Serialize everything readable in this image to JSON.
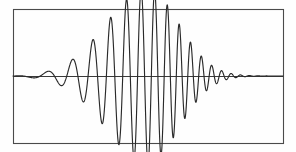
{
  "figure": {
    "name": "wave-packet-plot",
    "background_color": "#fefefe",
    "width": 296,
    "height": 152
  },
  "frame": {
    "label": "plot-frame",
    "x": 13,
    "y": 9,
    "width": 270,
    "height": 134,
    "stroke_color": "#4a4a4a",
    "stroke_width": 1.1
  },
  "axis": {
    "label": "zero-baseline-axis",
    "y": 76,
    "x_start": 13,
    "x_end": 283,
    "stroke_color": "#3a3a3a"
  },
  "curve": {
    "label": "wave-packet-curve",
    "stroke_color": "#2a2a2a",
    "stroke_width": 1.15,
    "clipped_top": true,
    "clipped_bottom": true
  },
  "chart_data": {
    "type": "line",
    "title": "",
    "subtitle": "",
    "xlabel": "",
    "ylabel": "",
    "legend": [],
    "grid": false,
    "annotations": [],
    "xlim": [
      0,
      1
    ],
    "ylim": [
      -1.35,
      1.35
    ],
    "axis_baseline": 0,
    "envelope": {
      "type": "asymmetric-gaussian",
      "peak_x": 0.497,
      "rise_width": 0.215,
      "decay_width": 0.165,
      "peak_amplitude": 1.3,
      "flat_lead_in_until_x": 0.035
    },
    "chirp": {
      "description": "instantaneous frequency increases left to right",
      "phase_cycles_start": 0.0,
      "phase_cycles_end": 21.5,
      "frequency_start_cycles_per_unit": 6.0,
      "frequency_end_cycles_per_unit": 34.0
    },
    "series": [
      {
        "name": "wave packet",
        "color": "#2a2a2a",
        "x": [
          0.0,
          0.02,
          0.04,
          0.06,
          0.08,
          0.1,
          0.12,
          0.14,
          0.16,
          0.18,
          0.2,
          0.22,
          0.24,
          0.26,
          0.28,
          0.3,
          0.32,
          0.34,
          0.36,
          0.38,
          0.4,
          0.42,
          0.44,
          0.46,
          0.48,
          0.5,
          0.52,
          0.54,
          0.56,
          0.58,
          0.6,
          0.62,
          0.64,
          0.66,
          0.68,
          0.7,
          0.72,
          0.74,
          0.76,
          0.78,
          0.8,
          0.82,
          0.84,
          0.86,
          0.88,
          0.9,
          0.92,
          0.94,
          0.96,
          0.98,
          1.0
        ],
        "y": [
          0.0,
          0.01,
          0.06,
          0.11,
          0.09,
          0.0,
          -0.13,
          -0.18,
          -0.09,
          0.12,
          0.33,
          0.4,
          0.27,
          -0.05,
          -0.41,
          -0.62,
          -0.55,
          -0.17,
          0.35,
          0.76,
          0.84,
          0.52,
          -0.07,
          -0.69,
          -1.05,
          -0.96,
          -0.4,
          0.4,
          1.08,
          1.25,
          0.83,
          -0.02,
          -0.88,
          -1.28,
          -1.0,
          -0.22,
          0.67,
          1.15,
          0.98,
          0.26,
          -0.57,
          -1.0,
          -0.82,
          -0.18,
          0.5,
          0.82,
          0.62,
          0.1,
          -0.4,
          -0.62,
          -0.4
        ]
      }
    ],
    "peaks": [
      {
        "x_px": 25,
        "y_px": 70,
        "amplitude": 0.09
      },
      {
        "x_px": 45,
        "y_px": 62,
        "amplitude": 0.21
      },
      {
        "x_px": 62,
        "y_px": 48,
        "amplitude": 0.42
      },
      {
        "x_px": 79,
        "y_px": 33,
        "amplitude": 0.65
      },
      {
        "x_px": 96,
        "y_px": 21,
        "amplitude": 0.83
      },
      {
        "x_px": 113,
        "y_px": 14,
        "amplitude": 0.94
      },
      {
        "x_px": 133,
        "y_px": 10,
        "amplitude": 1.0
      },
      {
        "x_px": 147,
        "y_px": 4,
        "amplitude": 1.3
      },
      {
        "x_px": 157,
        "y_px": 12,
        "amplitude": 0.97
      },
      {
        "x_px": 168,
        "y_px": 16,
        "amplitude": 0.9
      },
      {
        "x_px": 180,
        "y_px": 24,
        "amplitude": 0.78
      },
      {
        "x_px": 192,
        "y_px": 32,
        "amplitude": 0.66
      },
      {
        "x_px": 203,
        "y_px": 42,
        "amplitude": 0.51
      },
      {
        "x_px": 214,
        "y_px": 50,
        "amplitude": 0.39
      },
      {
        "x_px": 224,
        "y_px": 57,
        "amplitude": 0.28
      },
      {
        "x_px": 234,
        "y_px": 63,
        "amplitude": 0.19
      },
      {
        "x_px": 244,
        "y_px": 67,
        "amplitude": 0.13
      },
      {
        "x_px": 253,
        "y_px": 70,
        "amplitude": 0.09
      },
      {
        "x_px": 262,
        "y_px": 72,
        "amplitude": 0.06
      },
      {
        "x_px": 271,
        "y_px": 74,
        "amplitude": 0.03
      }
    ],
    "troughs": [
      {
        "x_px": 35,
        "y_px": 82,
        "amplitude": -0.09
      },
      {
        "x_px": 53,
        "y_px": 90,
        "amplitude": -0.21
      },
      {
        "x_px": 70,
        "y_px": 104,
        "amplitude": -0.42
      },
      {
        "x_px": 87,
        "y_px": 119,
        "amplitude": -0.64
      },
      {
        "x_px": 104,
        "y_px": 131,
        "amplitude": -0.82
      },
      {
        "x_px": 122,
        "y_px": 139,
        "amplitude": -0.94
      },
      {
        "x_px": 137,
        "y_px": 143,
        "amplitude": -1.0
      },
      {
        "x_px": 142,
        "y_px": 148,
        "amplitude": -1.28
      },
      {
        "x_px": 152,
        "y_px": 142,
        "amplitude": -0.99
      },
      {
        "x_px": 163,
        "y_px": 137,
        "amplitude": -0.91
      },
      {
        "x_px": 175,
        "y_px": 128,
        "amplitude": -0.78
      },
      {
        "x_px": 186,
        "y_px": 119,
        "amplitude": -0.65
      },
      {
        "x_px": 197,
        "y_px": 110,
        "amplitude": -0.51
      },
      {
        "x_px": 208,
        "y_px": 101,
        "amplitude": -0.38
      },
      {
        "x_px": 219,
        "y_px": 94,
        "amplitude": -0.28
      },
      {
        "x_px": 229,
        "y_px": 88,
        "amplitude": -0.19
      },
      {
        "x_px": 239,
        "y_px": 84,
        "amplitude": -0.13
      },
      {
        "x_px": 248,
        "y_px": 81,
        "amplitude": -0.09
      },
      {
        "x_px": 257,
        "y_px": 79,
        "amplitude": -0.06
      },
      {
        "x_px": 266,
        "y_px": 77,
        "amplitude": -0.04
      }
    ]
  }
}
